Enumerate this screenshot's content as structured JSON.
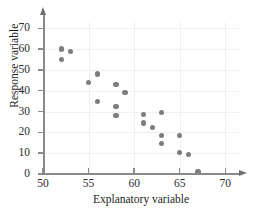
{
  "chart_data": {
    "type": "scatter",
    "title": "",
    "xlabel": "Explanatory variable",
    "ylabel": "Response variable",
    "xlim": [
      50,
      71.5
    ],
    "ylim": [
      0,
      73
    ],
    "xticks": [
      50,
      55,
      60,
      65,
      70
    ],
    "yticks": [
      0,
      10,
      20,
      30,
      40,
      50,
      60,
      70
    ],
    "grid": true,
    "legend": null,
    "marker_color": "#7d7d7d",
    "axis_color": "#8a8a8a",
    "points": [
      {
        "x": 52,
        "y": 60
      },
      {
        "x": 53,
        "y": 59
      },
      {
        "x": 52,
        "y": 55
      },
      {
        "x": 56,
        "y": 48
      },
      {
        "x": 55,
        "y": 44
      },
      {
        "x": 58,
        "y": 43
      },
      {
        "x": 59,
        "y": 39
      },
      {
        "x": 56,
        "y": 35
      },
      {
        "x": 58,
        "y": 32.5
      },
      {
        "x": 63,
        "y": 29.5
      },
      {
        "x": 61,
        "y": 28.5
      },
      {
        "x": 58,
        "y": 28
      },
      {
        "x": 61,
        "y": 24.5
      },
      {
        "x": 62,
        "y": 22.5
      },
      {
        "x": 63,
        "y": 18.5
      },
      {
        "x": 65,
        "y": 18.5
      },
      {
        "x": 63,
        "y": 14.5
      },
      {
        "x": 65,
        "y": 10.5
      },
      {
        "x": 66,
        "y": 9.5
      },
      {
        "x": 67,
        "y": 1
      }
    ]
  }
}
